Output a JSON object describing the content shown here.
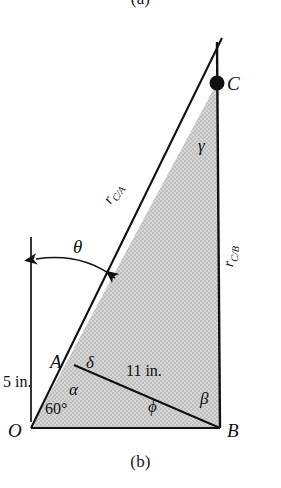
{
  "figure": {
    "caption_top": "(a)",
    "caption_bottom": "(b)",
    "type": "kinematics-triangle-diagram",
    "colors": {
      "stroke": "#111111",
      "fill": "#c9c9c9",
      "background": "#ffffff"
    }
  },
  "points": {
    "O": "O",
    "A": "A",
    "B": "B",
    "C": "C"
  },
  "angles": {
    "theta": "θ",
    "alpha": "α",
    "beta": "β",
    "gamma": "γ",
    "delta": "δ",
    "phi": "ϕ",
    "sixty": "60°"
  },
  "dimensions": {
    "oa_length": "5 in.",
    "ab_length": "11 in."
  },
  "vectors": {
    "r_ca_base": "r",
    "r_ca_sub": "C/A",
    "r_cb_base": "r",
    "r_cb_sub": "C/B"
  },
  "geometry": {
    "O": [
      31,
      428
    ],
    "A": [
      74,
      365
    ],
    "B": [
      220,
      428
    ],
    "C": [
      217,
      83
    ],
    "vertical_ref_top": [
      31,
      237
    ],
    "vertical_ref_bottom": [
      31,
      422
    ],
    "vertical_line_top": [
      217,
      42
    ],
    "theta_arc_start": [
      33,
      258
    ],
    "theta_arc_end": [
      118,
      280
    ]
  }
}
